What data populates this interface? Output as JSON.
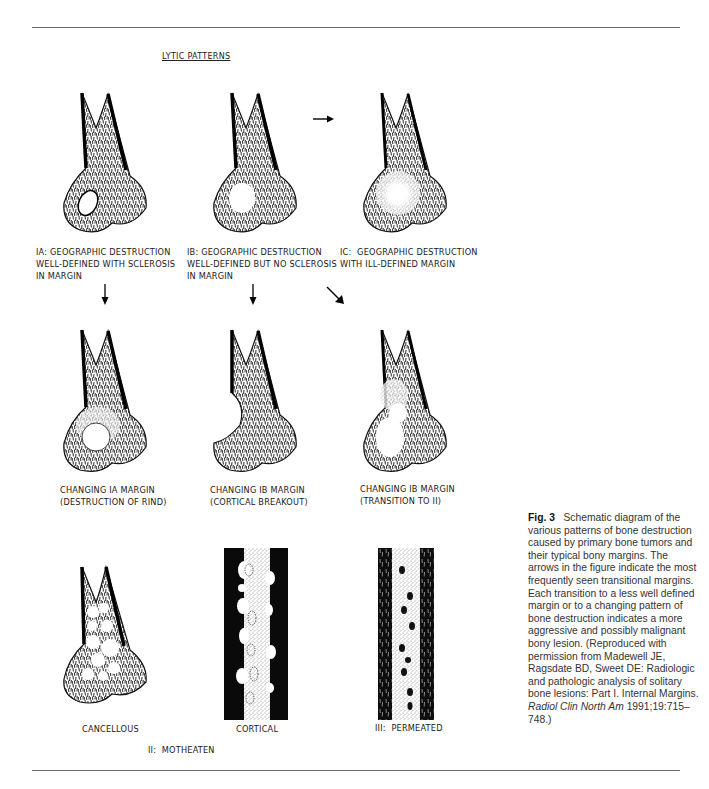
{
  "figure": {
    "title": "LYTIC PATTERNS",
    "rows": [
      {
        "panels": [
          {
            "id": "IA",
            "label_lines": [
              "IA: GEOGRAPHIC DESTRUCTION",
              "WELL-DEFINED WITH SCLEROSIS",
              "IN MARGIN"
            ]
          },
          {
            "id": "IB",
            "label_lines": [
              "IB: GEOGRAPHIC DESTRUCTION",
              "WELL-DEFINED BUT NO SCLEROSIS",
              "IN MARGIN"
            ]
          },
          {
            "id": "IC",
            "label_lines": [
              "IC:  GEOGRAPHIC DESTRUCTION",
              "WITH ILL-DEFINED MARGIN"
            ]
          }
        ]
      },
      {
        "panels": [
          {
            "id": "IA-changing",
            "label_lines": [
              "CHANGING IA MARGIN",
              "(DESTRUCTION OF RIND)"
            ]
          },
          {
            "id": "IB-changing-cortical",
            "label_lines": [
              "CHANGING IB MARGIN",
              "(CORTICAL BREAKOUT)"
            ]
          },
          {
            "id": "IB-changing-transition",
            "label_lines": [
              "CHANGING IB MARGIN",
              "(TRANSITION TO II)"
            ]
          }
        ]
      },
      {
        "panels": [
          {
            "id": "II-cancellous",
            "label_lines": [
              "CANCELLOUS"
            ]
          },
          {
            "id": "II-cortical",
            "label_lines": [
              "CORTICAL"
            ]
          },
          {
            "id": "III",
            "label_lines": [
              "III:  PERMEATED"
            ]
          }
        ],
        "group_label": "II:  MOTHEATEN"
      }
    ],
    "arrows": [
      {
        "from": "IB",
        "to": "IC",
        "direction": "right"
      },
      {
        "from": "IA",
        "to": "IA-changing",
        "direction": "down"
      },
      {
        "from": "IB",
        "to": "IB-changing-cortical",
        "direction": "down"
      },
      {
        "from": "IB",
        "to": "IB-changing-transition",
        "direction": "down-right"
      }
    ]
  },
  "caption": {
    "fig_label": "Fig. 3",
    "text_1": "Schematic diagram of the various patterns of bone destruction caused by primary bone tumors and their typical bony margins. The arrows in the figure indicate the most frequently seen transitional margins. Each transition to a less well defined margin or to a changing pattern of bone destruction indicates a more aggressive and possibly malignant bony lesion. (Reproduced with permission from Madewell JE, Ragsdate BD, Sweet DE: Radiologic and pathologic analysis of solitary bone lesions: Part I. Internal Margins. ",
    "journal": "Radiol Clin North Am",
    "text_2": " 1991;19:715–748.)"
  },
  "colors": {
    "ink": "#111111",
    "rule": "#6a6a6a",
    "caption_text": "#333333",
    "background": "#ffffff"
  }
}
